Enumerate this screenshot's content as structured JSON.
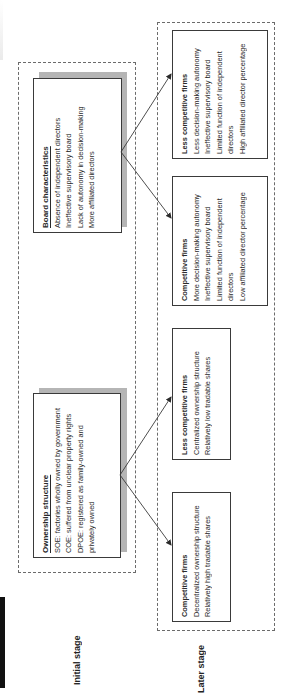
{
  "stages": {
    "initial_label": "Initial stage",
    "later_label": "Later stage"
  },
  "initial": {
    "board": {
      "title": "Board characteristics",
      "items": [
        "Absence of independent directors",
        "Ineffective supervisory board",
        "Lack of autonomy in decision-making",
        "More affiliated directors"
      ]
    },
    "ownership": {
      "title": "Ownership structure",
      "items": [
        "SOE: factories wholly owned by government",
        "COE: suffered from unclear property rights",
        "DPOE: registered as family-owned and",
        "privately owned"
      ]
    }
  },
  "later": {
    "board_less_competitive": {
      "title": "Less competitive firms",
      "items": [
        "Less decision-making autonomy",
        "Ineffective supervisory board",
        "Limited function of independent",
        "directors",
        "High affiliated director percentage"
      ]
    },
    "board_competitive": {
      "title": "Competitive firms",
      "items": [
        "More decision-making autonomy",
        "Ineffective supervisory board",
        "Limited function of independent",
        "directors",
        "Low affiliated director percentage"
      ]
    },
    "ownership_less_competitive": {
      "title": "Less competitive firms",
      "items": [
        "Centralized ownership structure",
        "Relatively low tradable shares"
      ]
    },
    "ownership_competitive": {
      "title": "Competitive firms",
      "items": [
        "Decentralized ownership structure",
        "Relatively high tradable shares"
      ]
    }
  },
  "colors": {
    "border": "#3a3a3a",
    "dashed": "#6b6b6b",
    "shadow": "#b5b5b5",
    "text": "#2a2a2a"
  }
}
